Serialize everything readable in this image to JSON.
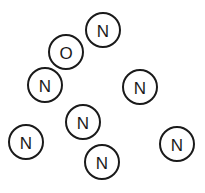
{
  "diagram": {
    "type": "scattered-labeled-nodes",
    "stroke_color": "#1a1a1a",
    "background": "#ffffff",
    "node_radius": 17,
    "nodes": [
      {
        "id": "n1",
        "label": "N",
        "cx": 103,
        "cy": 30
      },
      {
        "id": "n2",
        "label": "O",
        "cx": 66,
        "cy": 52
      },
      {
        "id": "n3",
        "label": "N",
        "cx": 45,
        "cy": 85
      },
      {
        "id": "n4",
        "label": "N",
        "cx": 140,
        "cy": 87
      },
      {
        "id": "n5",
        "label": "N",
        "cx": 83,
        "cy": 122
      },
      {
        "id": "n6",
        "label": "N",
        "cx": 26,
        "cy": 142
      },
      {
        "id": "n7",
        "label": "N",
        "cx": 177,
        "cy": 144
      },
      {
        "id": "n8",
        "label": "N",
        "cx": 102,
        "cy": 162
      }
    ]
  }
}
